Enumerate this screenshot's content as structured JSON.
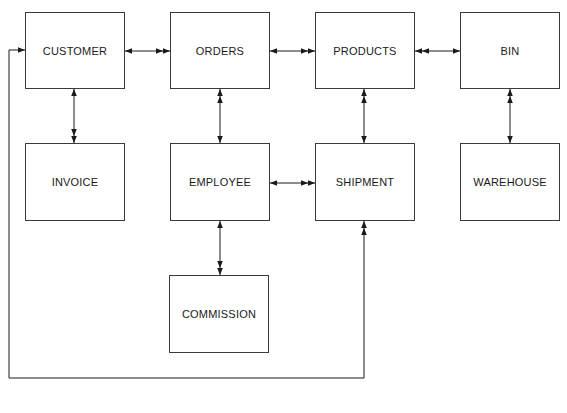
{
  "diagram": {
    "type": "entity-relationship",
    "entities": [
      {
        "id": "customer",
        "label": "CUSTOMER",
        "x": 25,
        "y": 12,
        "w": 100,
        "h": 77
      },
      {
        "id": "orders",
        "label": "ORDERS",
        "x": 170,
        "y": 12,
        "w": 100,
        "h": 77
      },
      {
        "id": "products",
        "label": "PRODUCTS",
        "x": 315,
        "y": 12,
        "w": 100,
        "h": 77
      },
      {
        "id": "bin",
        "label": "BIN",
        "x": 460,
        "y": 12,
        "w": 100,
        "h": 77
      },
      {
        "id": "invoice",
        "label": "INVOICE",
        "x": 25,
        "y": 143,
        "w": 100,
        "h": 78
      },
      {
        "id": "employee",
        "label": "EMPLOYEE",
        "x": 170,
        "y": 143,
        "w": 100,
        "h": 78
      },
      {
        "id": "shipment",
        "label": "SHIPMENT",
        "x": 315,
        "y": 143,
        "w": 100,
        "h": 78
      },
      {
        "id": "warehouse",
        "label": "WAREHOUSE",
        "x": 460,
        "y": 143,
        "w": 100,
        "h": 78
      },
      {
        "id": "commission",
        "label": "COMMISSION",
        "x": 169,
        "y": 275,
        "w": 100,
        "h": 78
      }
    ],
    "relationships": [
      {
        "from": "customer",
        "to": "orders",
        "from_end": "one",
        "to_end": "many"
      },
      {
        "from": "orders",
        "to": "products",
        "from_end": "one",
        "to_end": "many"
      },
      {
        "from": "products",
        "to": "bin",
        "from_end": "many",
        "to_end": "one"
      },
      {
        "from": "customer",
        "to": "invoice",
        "from_end": "one",
        "to_end": "many"
      },
      {
        "from": "orders",
        "to": "employee",
        "from_end": "many",
        "to_end": "one"
      },
      {
        "from": "products",
        "to": "shipment",
        "from_end": "many",
        "to_end": "one"
      },
      {
        "from": "bin",
        "to": "warehouse",
        "from_end": "many",
        "to_end": "one"
      },
      {
        "from": "employee",
        "to": "shipment",
        "from_end": "one",
        "to_end": "many"
      },
      {
        "from": "employee",
        "to": "commission",
        "from_end": "one",
        "to_end": "many"
      },
      {
        "from": "customer",
        "to": "shipment",
        "from_end": "one",
        "to_end": "many",
        "routing": "loop-around-bottom"
      }
    ],
    "colors": {
      "line": "#1a1a1a",
      "box_border": "#3a3a3a",
      "background": "#ffffff"
    }
  }
}
